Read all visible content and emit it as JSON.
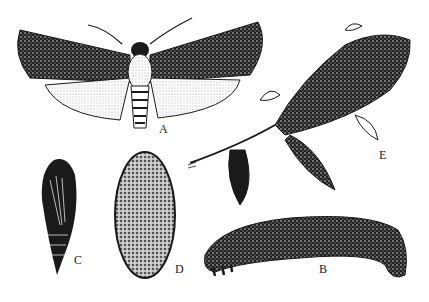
{
  "figure": {
    "labels": {
      "adult": "A",
      "larva": "B",
      "pupa": "C",
      "cocoon": "D",
      "host_plant": "E"
    },
    "colors": {
      "ink": "#1a1a1a",
      "paper": "#ffffff",
      "shade": "#9a9a9a"
    }
  }
}
